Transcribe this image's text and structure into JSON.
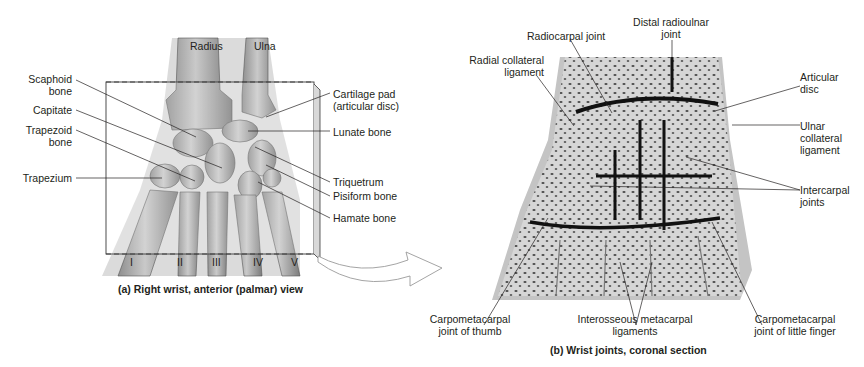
{
  "panel_a": {
    "caption": "(a) Right wrist, anterior (palmar) view",
    "bone_labels": {
      "radius": "Radius",
      "ulna": "Ulna"
    },
    "metacarpals": [
      "I",
      "II",
      "III",
      "IV",
      "V"
    ],
    "left_labels": [
      {
        "line1": "Scaphoid",
        "line2": "bone"
      },
      {
        "line1": "Capitate",
        "line2": ""
      },
      {
        "line1": "Trapezoid",
        "line2": "bone"
      },
      {
        "line1": "Trapezium",
        "line2": ""
      }
    ],
    "right_labels": [
      {
        "line1": "Cartilage pad",
        "line2": "(articular disc)"
      },
      {
        "line1": "Lunate bone",
        "line2": ""
      },
      {
        "line1": "Triquetrum",
        "line2": ""
      },
      {
        "line1": "Pisiform bone",
        "line2": ""
      },
      {
        "line1": "Hamate bone",
        "line2": ""
      }
    ]
  },
  "panel_b": {
    "caption": "(b) Wrist joints, coronal section",
    "top_labels": [
      {
        "line1": "Radiocarpal joint",
        "line2": ""
      },
      {
        "line1": "Distal radioulnar",
        "line2": "joint"
      }
    ],
    "left_labels": [
      {
        "line1": "Radial collateral",
        "line2": "ligament"
      }
    ],
    "right_labels": [
      {
        "line1": "Articular",
        "line2": "disc"
      },
      {
        "line1": "Ulnar",
        "line2": "collateral",
        "line3": "ligament"
      },
      {
        "line1": "Intercarpal",
        "line2": "joints"
      }
    ],
    "bottom_labels": [
      {
        "line1": "Carpometacarpal",
        "line2": "joint of thumb"
      },
      {
        "line1": "Interosseous metacarpal",
        "line2": "ligaments"
      },
      {
        "line1": "Carpometacarpal",
        "line2": "joint of little finger"
      }
    ]
  }
}
